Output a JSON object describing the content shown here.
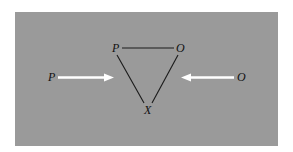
{
  "figure": {
    "type": "balance-theory-triangle",
    "background_color": "#9a9a9a",
    "line_color": "#1a1a1a",
    "arrow_color": "#ffffff"
  },
  "triangle": {
    "nodes": [
      {
        "id": "P",
        "label": "P",
        "x": 117,
        "y": 49
      },
      {
        "id": "O",
        "label": "O",
        "x": 180,
        "y": 49
      },
      {
        "id": "X",
        "label": "X",
        "x": 148,
        "y": 110
      }
    ],
    "edges": [
      {
        "from": "P",
        "to": "O"
      },
      {
        "from": "P",
        "to": "X"
      },
      {
        "from": "O",
        "to": "X"
      }
    ]
  },
  "arrows": [
    {
      "label": "P",
      "side": "left",
      "direction": "right"
    },
    {
      "label": "O",
      "side": "right",
      "direction": "left"
    }
  ]
}
